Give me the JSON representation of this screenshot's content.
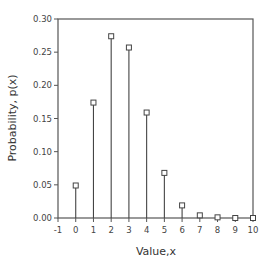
{
  "chart_data": {
    "type": "stem",
    "title": "",
    "xlabel": "Value,x",
    "ylabel": "Probability, p(x)",
    "x": [
      0,
      1,
      2,
      3,
      4,
      5,
      6,
      7,
      8,
      9,
      10
    ],
    "values": [
      0.049,
      0.174,
      0.274,
      0.257,
      0.159,
      0.068,
      0.019,
      0.004,
      0.001,
      0.0,
      0.0
    ],
    "xlim": [
      -1,
      10
    ],
    "ylim": [
      0,
      0.3
    ],
    "xticks": [
      "-1",
      "0",
      "1",
      "2",
      "3",
      "4",
      "5",
      "6",
      "7",
      "8",
      "9",
      "10"
    ],
    "yticks": [
      "0.00",
      "0.05",
      "0.10",
      "0.15",
      "0.20",
      "0.25",
      "0.30"
    ],
    "grid": false,
    "legend": null,
    "marker": "open-square"
  },
  "colors": {
    "axis": "#555555",
    "stem": "#444444",
    "marker_fill": "#ffffff"
  }
}
